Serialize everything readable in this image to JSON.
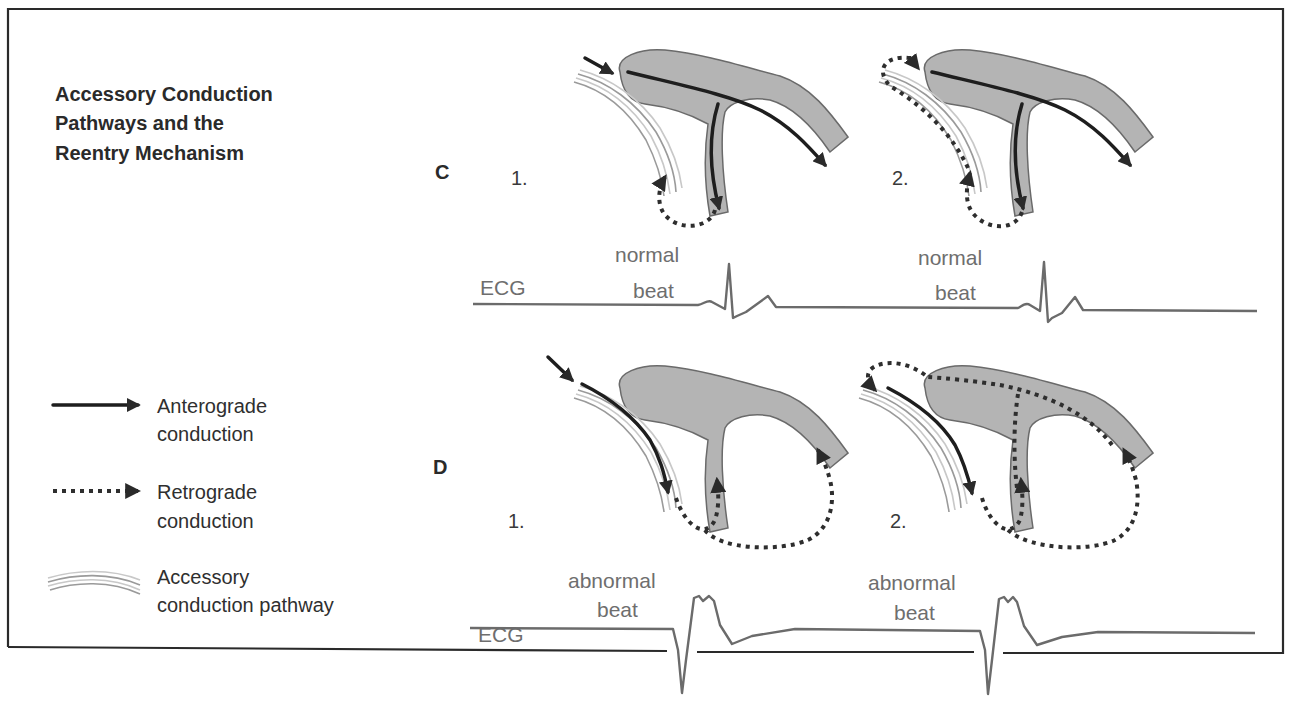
{
  "title": {
    "line1": "Accessory Conduction",
    "line2": "Pathways and the",
    "line3": "Reentry Mechanism"
  },
  "panels": {
    "C": {
      "label": "C",
      "steps": [
        {
          "number": "1.",
          "description": "Anterograde conduction through AV node/His-Purkinje; retrograde through accessory pathway"
        },
        {
          "number": "2.",
          "description": "Retrograde conduction up accessory pathway re-entering atria"
        }
      ],
      "ecg": {
        "label": "ECG",
        "beat_label_line1": "normal",
        "beat_label_line2": "beat"
      }
    },
    "D": {
      "label": "D",
      "steps": [
        {
          "number": "1.",
          "description": "Anterograde conduction through accessory pathway; retrograde into ventricular branches"
        },
        {
          "number": "2.",
          "description": "Retrograde conduction through His-Purkinje and AV node re-entering atria"
        }
      ],
      "ecg": {
        "label": "ECG",
        "beat_label_line1": "abnormal",
        "beat_label_line2": "beat"
      }
    }
  },
  "legend": [
    {
      "icon": "solid-arrow-icon",
      "line1": "Anterograde",
      "line2": "conduction"
    },
    {
      "icon": "dotted-arrow-icon",
      "line1": "Retrograde",
      "line2": "conduction"
    },
    {
      "icon": "accessory-pathway-icon",
      "line1": "Accessory",
      "line2": "conduction pathway"
    }
  ],
  "colors": {
    "node_fill": "#b4b4b4",
    "anterograde": "#1e1e1e",
    "retrograde": "#2e2e2e",
    "ecg_trace": "#6b6b6b",
    "accessory_pathway": "#9a9a9a"
  }
}
